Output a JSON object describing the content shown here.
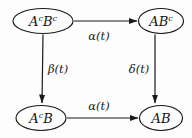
{
  "diagram": {
    "type": "commutative-diagram",
    "background_color": "#fdfdfd",
    "stroke_color": "#1a1a1a",
    "text_color": "#151515",
    "nodes": [
      {
        "id": "top-left",
        "base": "A",
        "sup1": "c",
        "mid": "B",
        "sup2": "c",
        "plain": "A^cB^c",
        "cx": 43,
        "cy": 21,
        "rx": 30,
        "ry": 12.5
      },
      {
        "id": "top-right",
        "base": "A",
        "sup1": "",
        "mid": "B",
        "sup2": "c",
        "plain": "AB^c",
        "cx": 161,
        "cy": 21,
        "rx": 22.5,
        "ry": 12.5
      },
      {
        "id": "bottom-left",
        "base": "A",
        "sup1": "c",
        "mid": "B",
        "sup2": "",
        "plain": "A^cB",
        "cx": 41,
        "cy": 118,
        "rx": 25,
        "ry": 12.5
      },
      {
        "id": "bottom-right",
        "base": "A",
        "sup1": "",
        "mid": "B",
        "sup2": "",
        "plain": "AB",
        "cx": 161,
        "cy": 118,
        "rx": 21.5,
        "ry": 12.5
      }
    ],
    "edges": [
      {
        "id": "top-edge",
        "from": "top-left",
        "to": "top-right",
        "label": "α(t)",
        "label_x": 99,
        "label_y": 37,
        "direction": "horizontal-right"
      },
      {
        "id": "left-edge",
        "from": "top-left",
        "to": "bottom-left",
        "label": "β(t)",
        "label_x": 58,
        "label_y": 70,
        "direction": "vertical-down"
      },
      {
        "id": "right-edge",
        "from": "top-right",
        "to": "bottom-right",
        "label": "δ(t)",
        "label_x": 139,
        "label_y": 70,
        "direction": "vertical-down"
      },
      {
        "id": "bottom-edge",
        "from": "bottom-left",
        "to": "bottom-right",
        "label": "α(t)",
        "label_x": 99,
        "label_y": 107,
        "direction": "horizontal-right"
      }
    ]
  }
}
